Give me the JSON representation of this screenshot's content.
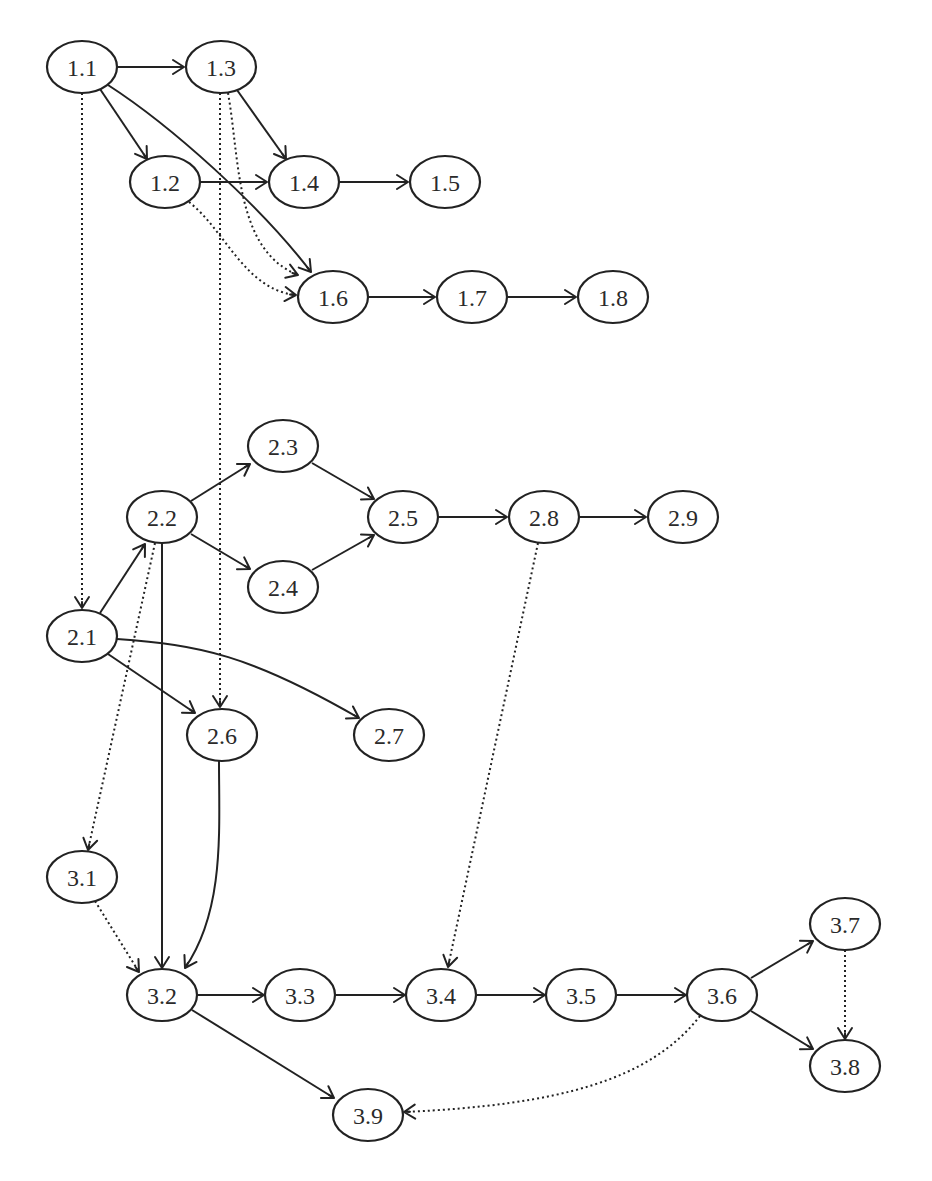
{
  "diagram": {
    "type": "directed-graph",
    "colors": {
      "stroke": "#222222",
      "node_fill": "#ffffff",
      "label": "#2a2a2a",
      "background": "#ffffff"
    },
    "node_size": {
      "rx": 35,
      "ry": 26
    },
    "nodes": [
      {
        "id": "1.1",
        "label": "1.1",
        "x": 82,
        "y": 67
      },
      {
        "id": "1.3",
        "label": "1.3",
        "x": 221,
        "y": 67
      },
      {
        "id": "1.2",
        "label": "1.2",
        "x": 165,
        "y": 182
      },
      {
        "id": "1.4",
        "label": "1.4",
        "x": 304,
        "y": 182
      },
      {
        "id": "1.5",
        "label": "1.5",
        "x": 445,
        "y": 182
      },
      {
        "id": "1.6",
        "label": "1.6",
        "x": 333,
        "y": 297
      },
      {
        "id": "1.7",
        "label": "1.7",
        "x": 472,
        "y": 297
      },
      {
        "id": "1.8",
        "label": "1.8",
        "x": 613,
        "y": 297
      },
      {
        "id": "2.3",
        "label": "2.3",
        "x": 283,
        "y": 446
      },
      {
        "id": "2.2",
        "label": "2.2",
        "x": 162,
        "y": 517
      },
      {
        "id": "2.5",
        "label": "2.5",
        "x": 403,
        "y": 517
      },
      {
        "id": "2.8",
        "label": "2.8",
        "x": 544,
        "y": 517
      },
      {
        "id": "2.9",
        "label": "2.9",
        "x": 683,
        "y": 517
      },
      {
        "id": "2.4",
        "label": "2.4",
        "x": 283,
        "y": 587
      },
      {
        "id": "2.1",
        "label": "2.1",
        "x": 82,
        "y": 636
      },
      {
        "id": "2.6",
        "label": "2.6",
        "x": 222,
        "y": 735
      },
      {
        "id": "2.7",
        "label": "2.7",
        "x": 389,
        "y": 735
      },
      {
        "id": "3.1",
        "label": "3.1",
        "x": 82,
        "y": 877
      },
      {
        "id": "3.7",
        "label": "3.7",
        "x": 845,
        "y": 924
      },
      {
        "id": "3.2",
        "label": "3.2",
        "x": 162,
        "y": 995
      },
      {
        "id": "3.3",
        "label": "3.3",
        "x": 300,
        "y": 995
      },
      {
        "id": "3.4",
        "label": "3.4",
        "x": 441,
        "y": 995
      },
      {
        "id": "3.5",
        "label": "3.5",
        "x": 581,
        "y": 995
      },
      {
        "id": "3.6",
        "label": "3.6",
        "x": 722,
        "y": 995
      },
      {
        "id": "3.8",
        "label": "3.8",
        "x": 845,
        "y": 1066
      },
      {
        "id": "3.9",
        "label": "3.9",
        "x": 368,
        "y": 1115
      }
    ],
    "edges": [
      {
        "from": "1.1",
        "to": "1.3",
        "style": "solid",
        "path": "M117,67 L184,67",
        "head": [
          184,
          67,
          0
        ]
      },
      {
        "from": "1.1",
        "to": "1.2",
        "style": "solid",
        "path": "M100,89 L147,159",
        "head": [
          147,
          159,
          56
        ]
      },
      {
        "from": "1.1",
        "to": "1.6",
        "style": "solid",
        "path": "M108,85 C170,125 260,205 311,272",
        "head": [
          311,
          272,
          52
        ]
      },
      {
        "from": "1.1",
        "to": "2.1",
        "style": "dotted",
        "path": "M82,93 L82,608",
        "head": [
          82,
          608,
          90
        ]
      },
      {
        "from": "1.3",
        "to": "1.4",
        "style": "solid",
        "path": "M237,90 L286,159",
        "head": [
          286,
          159,
          55
        ]
      },
      {
        "from": "1.3",
        "to": "1.6",
        "style": "dotted",
        "path": "M228,93 C240,160 235,250 298,275",
        "head": [
          298,
          275,
          20
        ]
      },
      {
        "from": "1.3",
        "to": "2.6",
        "style": "dotted",
        "path": "M220,93 L220,707",
        "head": [
          220,
          707,
          90
        ]
      },
      {
        "from": "1.2",
        "to": "1.4",
        "style": "solid",
        "path": "M200,182 L267,182",
        "head": [
          267,
          182,
          0
        ]
      },
      {
        "from": "1.2",
        "to": "1.6",
        "style": "dotted",
        "path": "M189,202 C225,230 245,290 296,295",
        "head": [
          296,
          295,
          5
        ]
      },
      {
        "from": "1.4",
        "to": "1.5",
        "style": "solid",
        "path": "M339,182 L408,182",
        "head": [
          408,
          182,
          0
        ]
      },
      {
        "from": "1.6",
        "to": "1.7",
        "style": "solid",
        "path": "M368,297 L435,297",
        "head": [
          435,
          297,
          0
        ]
      },
      {
        "from": "1.7",
        "to": "1.8",
        "style": "solid",
        "path": "M507,297 L576,297",
        "head": [
          576,
          297,
          0
        ]
      },
      {
        "from": "2.2",
        "to": "2.3",
        "style": "solid",
        "path": "M191,501 L250,464",
        "head": [
          250,
          464,
          -32
        ]
      },
      {
        "from": "2.2",
        "to": "2.4",
        "style": "solid",
        "path": "M191,534 L250,569",
        "head": [
          250,
          569,
          31
        ]
      },
      {
        "from": "2.3",
        "to": "2.5",
        "style": "solid",
        "path": "M312,463 L374,499",
        "head": [
          374,
          499,
          30
        ]
      },
      {
        "from": "2.4",
        "to": "2.5",
        "style": "solid",
        "path": "M312,570 L374,535",
        "head": [
          374,
          535,
          -30
        ]
      },
      {
        "from": "2.5",
        "to": "2.8",
        "style": "solid",
        "path": "M438,517 L507,517",
        "head": [
          507,
          517,
          0
        ]
      },
      {
        "from": "2.8",
        "to": "2.9",
        "style": "solid",
        "path": "M579,517 L646,517",
        "head": [
          646,
          517,
          0
        ]
      },
      {
        "from": "2.8",
        "to": "3.4",
        "style": "dotted",
        "path": "M538,543 L448,967",
        "head": [
          448,
          967,
          102
        ]
      },
      {
        "from": "2.1",
        "to": "2.2",
        "style": "solid",
        "path": "M100,613 L145,544",
        "head": [
          145,
          544,
          -57
        ]
      },
      {
        "from": "2.1",
        "to": "2.6",
        "style": "solid",
        "path": "M108,654 L195,713",
        "head": [
          195,
          713,
          34
        ]
      },
      {
        "from": "2.1",
        "to": "2.7",
        "style": "solid",
        "path": "M117,639 C200,645 250,655 359,718",
        "head": [
          359,
          718,
          30
        ]
      },
      {
        "from": "2.2",
        "to": "3.1",
        "style": "dotted",
        "path": "M155,543 L88,850",
        "head": [
          88,
          850,
          102
        ]
      },
      {
        "from": "2.2",
        "to": "3.2",
        "style": "solid",
        "path": "M162,543 L162,968",
        "head": [
          162,
          968,
          90
        ]
      },
      {
        "from": "2.6",
        "to": "3.2",
        "style": "solid",
        "path": "M219,761 C219,830 225,910 185,968",
        "head": [
          185,
          968,
          120
        ]
      },
      {
        "from": "3.1",
        "to": "3.2",
        "style": "dotted",
        "path": "M95,901 L139,972",
        "head": [
          139,
          972,
          55
        ]
      },
      {
        "from": "3.2",
        "to": "3.3",
        "style": "solid",
        "path": "M197,995 L264,995",
        "head": [
          264,
          995,
          0
        ]
      },
      {
        "from": "3.2",
        "to": "3.9",
        "style": "solid",
        "path": "M192,1010 L334,1098",
        "head": [
          334,
          1098,
          32
        ]
      },
      {
        "from": "3.3",
        "to": "3.4",
        "style": "solid",
        "path": "M335,995 L405,995",
        "head": [
          405,
          995,
          0
        ]
      },
      {
        "from": "3.4",
        "to": "3.5",
        "style": "solid",
        "path": "M476,995 L545,995",
        "head": [
          545,
          995,
          0
        ]
      },
      {
        "from": "3.5",
        "to": "3.6",
        "style": "solid",
        "path": "M616,995 L686,995",
        "head": [
          686,
          995,
          0
        ]
      },
      {
        "from": "3.6",
        "to": "3.7",
        "style": "solid",
        "path": "M751,978 L813,941",
        "head": [
          813,
          941,
          -31
        ]
      },
      {
        "from": "3.6",
        "to": "3.8",
        "style": "solid",
        "path": "M751,1011 L813,1049",
        "head": [
          813,
          1049,
          31
        ]
      },
      {
        "from": "3.7",
        "to": "3.8",
        "style": "dotted",
        "path": "M845,950 L845,1039",
        "head": [
          845,
          1039,
          90
        ]
      },
      {
        "from": "3.6",
        "to": "3.9",
        "style": "dotted",
        "path": "M700,1016 C650,1080 560,1105 404,1112",
        "head": [
          404,
          1112,
          178
        ]
      }
    ]
  }
}
